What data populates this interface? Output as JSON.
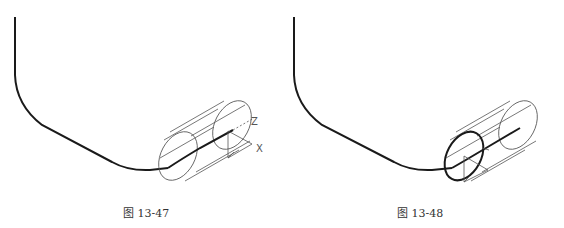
{
  "figures": [
    {
      "id": "13-47",
      "caption": "图 13-47",
      "axis_labels": {
        "z": "Z",
        "x": "X"
      },
      "description": "Path polyline with filleted corners and wireframe cylinder at its end, UCS icon at far end face"
    },
    {
      "id": "13-48",
      "caption": "图 13-48",
      "axis_labels": {
        "z": "Z",
        "x": "X"
      },
      "description": "Same path with cylinder; near end circle highlighted (bold) and UCS moved to near face"
    }
  ],
  "colors": {
    "line": "#1a1a1a",
    "wire": "#555555",
    "caption": "#333333"
  }
}
